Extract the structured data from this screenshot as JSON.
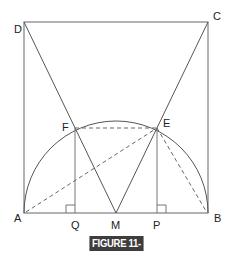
{
  "figure": {
    "caption": "FIGURE 11-28",
    "caption_bg": "#3d3d3d",
    "caption_fg": "#ffffff",
    "line_color": "#555555",
    "points": {
      "A": {
        "label": "A",
        "x": 24,
        "y": 213
      },
      "B": {
        "label": "B",
        "x": 208,
        "y": 213
      },
      "C": {
        "label": "C",
        "x": 208,
        "y": 22
      },
      "D": {
        "label": "D",
        "x": 24,
        "y": 22
      },
      "E": {
        "label": "E",
        "x": 157,
        "y": 128
      },
      "F": {
        "label": "F",
        "x": 75,
        "y": 128
      },
      "M": {
        "label": "M",
        "x": 116,
        "y": 213
      },
      "P": {
        "label": "P",
        "x": 157,
        "y": 213
      },
      "Q": {
        "label": "Q",
        "x": 75,
        "y": 213
      }
    },
    "segments_solid": [
      "AB",
      "BC",
      "CD",
      "DA",
      "DM",
      "CM",
      "FQ",
      "EP"
    ],
    "segments_dashed": [
      "FE",
      "AE",
      "EB"
    ],
    "arc": "semicircle centered at M through A and B",
    "right_angle_marks": [
      "Q",
      "P"
    ]
  }
}
